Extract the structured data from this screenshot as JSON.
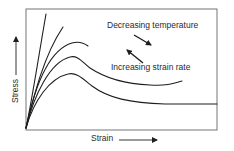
{
  "diagram": {
    "type": "stress-strain curves",
    "x_axis_label": "Strain",
    "y_axis_label": "Stress",
    "annotations": {
      "top": "Decreasing temperature",
      "bottom": "Increasing strain rate"
    },
    "curves_count": 5,
    "colors": {
      "line": "#1e1e1e",
      "frame": "#555555",
      "background": "#ffffff"
    }
  }
}
